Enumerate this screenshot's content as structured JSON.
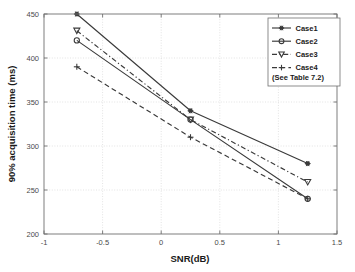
{
  "chart_data": {
    "type": "line",
    "title": "",
    "xlabel": "SNR(dB)",
    "ylabel": "90% acquisition time (ms)",
    "xlim": [
      -1,
      1.5
    ],
    "ylim": [
      200,
      450
    ],
    "xticks": [
      -1,
      -0.5,
      0,
      0.5,
      1,
      1.5
    ],
    "xtick_labels": [
      "-1",
      "-0.5",
      "0",
      "0.5",
      "1",
      "1.5"
    ],
    "yticks": [
      200,
      250,
      300,
      350,
      400,
      450
    ],
    "ytick_labels": [
      "200",
      "250",
      "300",
      "350",
      "400",
      "450"
    ],
    "grid": true,
    "legend_position": "top-right",
    "legend_note": "(See Table 7.2)",
    "x": [
      -0.72,
      0.25,
      1.25
    ],
    "series": [
      {
        "name": "Case1",
        "values": [
          450,
          340,
          280
        ],
        "linestyle": "solid",
        "marker": "star",
        "color": "#3a3a3a"
      },
      {
        "name": "Case2",
        "values": [
          420,
          330,
          240
        ],
        "linestyle": "solid",
        "marker": "circle",
        "color": "#3a3a3a"
      },
      {
        "name": "Case3",
        "values": [
          431,
          330,
          259
        ],
        "linestyle": "dashdot",
        "marker": "triangle-down",
        "color": "#3a3a3a"
      },
      {
        "name": "Case4",
        "values": [
          390,
          310,
          240
        ],
        "linestyle": "dashed",
        "marker": "plus",
        "color": "#3a3a3a"
      }
    ]
  },
  "legend": {
    "items": [
      {
        "label": "Case1"
      },
      {
        "label": "Case2"
      },
      {
        "label": "Case3"
      },
      {
        "label": "Case4"
      }
    ],
    "note": "(See Table 7.2)"
  },
  "axes": {
    "x_title": "SNR(dB)",
    "y_title": "90% acquisition time (ms)"
  }
}
